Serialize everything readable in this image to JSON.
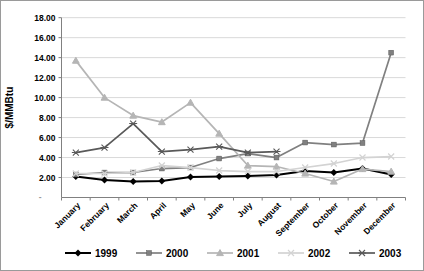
{
  "chart": {
    "y_axis_title": "$/MMBtu",
    "y_tick_labels": [
      "18.00",
      "16.00",
      "14.00",
      "12.00",
      "10.00",
      "8.00",
      "6.00",
      "4.00",
      "2.00"
    ],
    "zero_tick_label": "-",
    "grid_color": "#d9d9d9",
    "axis_color": "#808080",
    "text_color": "#000000"
  },
  "chart_data": {
    "type": "line",
    "title": "",
    "xlabel": "",
    "ylabel": "$/MMBtu",
    "ylim": [
      0,
      18
    ],
    "y_tick_step": 2,
    "grid": true,
    "legend_position": "bottom",
    "categories": [
      "January",
      "February",
      "March",
      "April",
      "May",
      "June",
      "July",
      "August",
      "September",
      "October",
      "November",
      "December"
    ],
    "series": [
      {
        "name": "1999",
        "color": "#000000",
        "marker": "diamond",
        "values": [
          2.1,
          1.75,
          1.6,
          1.65,
          2.05,
          2.1,
          2.15,
          2.25,
          2.65,
          2.5,
          2.9,
          2.3
        ]
      },
      {
        "name": "2000",
        "color": "#808080",
        "marker": "square",
        "values": [
          2.3,
          2.5,
          2.5,
          2.9,
          3.0,
          3.9,
          4.4,
          4.0,
          5.5,
          5.3,
          5.45,
          14.5
        ]
      },
      {
        "name": "2001",
        "color": "#b5b5b5",
        "marker": "triangle",
        "values": [
          13.7,
          10.0,
          8.2,
          7.55,
          9.5,
          6.4,
          3.2,
          3.1,
          2.4,
          1.6,
          2.85,
          2.6
        ]
      },
      {
        "name": "2002",
        "color": "#d3d3d3",
        "marker": "x",
        "values": [
          2.4,
          2.4,
          2.5,
          3.2,
          3.0,
          2.7,
          2.6,
          2.6,
          3.0,
          3.4,
          4.0,
          4.1
        ]
      },
      {
        "name": "2003",
        "color": "#595959",
        "marker": "asterisk",
        "values": [
          4.5,
          5.0,
          7.4,
          4.6,
          4.8,
          5.1,
          4.5,
          4.6,
          null,
          null,
          null,
          null
        ]
      }
    ]
  }
}
